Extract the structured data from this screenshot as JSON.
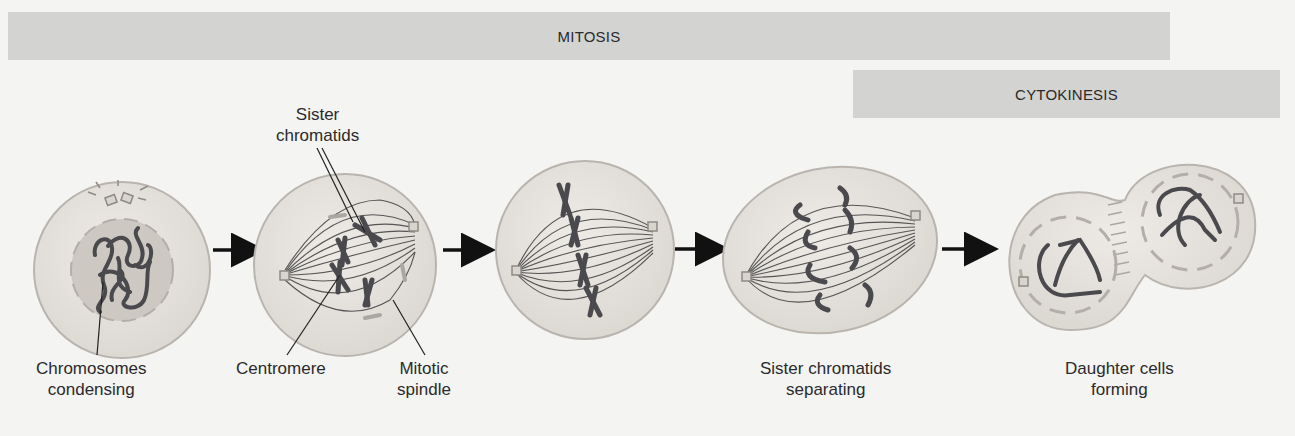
{
  "title_bands": {
    "mitosis": "MITOSIS",
    "cytokinesis": "CYTOKINESIS"
  },
  "stages": [
    {
      "id": "prophase-cell",
      "label_lines": [
        "Chromosomes",
        "condensing"
      ]
    },
    {
      "id": "prometaphase-cell",
      "labels": {
        "sister_chromatids": [
          "Sister",
          "chromatids"
        ],
        "centromere": [
          "Centromere"
        ],
        "mitotic_spindle": [
          "Mitotic",
          "spindle"
        ]
      }
    },
    {
      "id": "metaphase-cell",
      "label_lines": []
    },
    {
      "id": "anaphase-cell",
      "label_lines": [
        "Sister chromatids",
        "separating"
      ]
    },
    {
      "id": "telophase-cell",
      "label_lines": [
        "Daughter cells",
        "forming"
      ]
    }
  ],
  "colors": {
    "background": "#f4f4f3",
    "band": "#d3d3d1",
    "cell_fill": "#e6e3de",
    "cell_stroke": "#b9b4ae",
    "nucleus_fill": "#cdc8c2",
    "chromosome": "#4a4a4e",
    "spindle": "#555555",
    "arrow": "#111111"
  }
}
